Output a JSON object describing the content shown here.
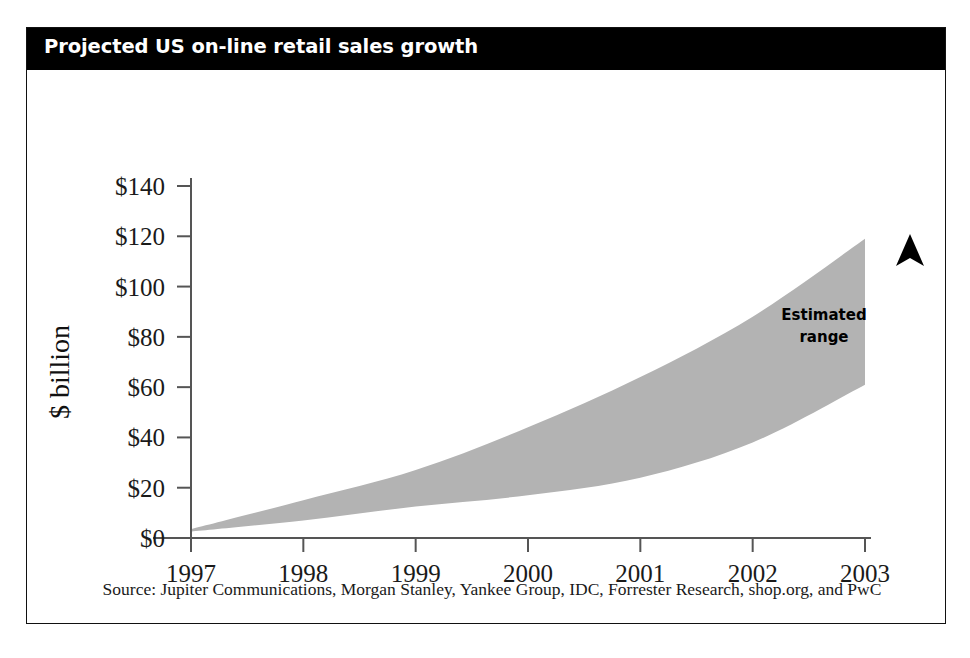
{
  "card": {
    "title": "Projected US on-line retail sales growth",
    "source_note": "Source: Jupiter Communications, Morgan Stanley, Yankee Group, IDC, Forrester Research, shop.org, and PwC"
  },
  "annotations": {
    "band_label_line1": "Estimated",
    "band_label_line2": "range",
    "arrow_icon": "up-arrowhead-icon"
  },
  "colors": {
    "banner_background": "#000000",
    "banner_text": "#ffffff",
    "band_fill": "#b3b3b3",
    "axis_line": "#555555",
    "card_border": "#111111",
    "text": "#1a1a1a"
  },
  "chart_data": {
    "type": "area",
    "title": "Projected US on-line retail sales growth",
    "xlabel": "",
    "ylabel": "$ billion",
    "x": [
      1997,
      1998,
      1999,
      2000,
      2001,
      2002,
      2003
    ],
    "xtick_labels": [
      "1997",
      "1998",
      "1999",
      "2000",
      "2001",
      "2002",
      "2003"
    ],
    "xlim": [
      1997,
      2003
    ],
    "ylim": [
      0,
      140
    ],
    "yticks": [
      0,
      20,
      40,
      60,
      80,
      100,
      120,
      140
    ],
    "ytick_labels": [
      "$0",
      "$20",
      "$40",
      "$60",
      "$80",
      "$100",
      "$120",
      "$140"
    ],
    "grid": false,
    "legend": "none",
    "band_name": "Estimated range",
    "series": [
      {
        "name": "Low estimate",
        "values": [
          2.5,
          7,
          12.5,
          17,
          24,
          38,
          61
        ]
      },
      {
        "name": "High estimate",
        "values": [
          3.5,
          15,
          27,
          44,
          64,
          88,
          119
        ]
      }
    ],
    "annotations": [
      {
        "text": "Estimated range",
        "x": 2002.2,
        "y": 84
      }
    ]
  }
}
